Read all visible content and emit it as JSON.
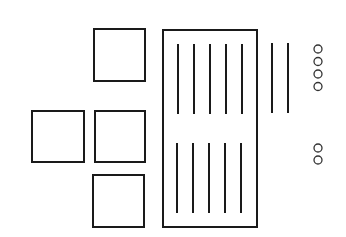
{
  "diagram": {
    "width": 346,
    "height": 237,
    "background": "#ffffff",
    "stroke": "#1a1a1a",
    "squares": [
      {
        "id": "square-top",
        "x": 94,
        "y": 29,
        "w": 51,
        "h": 52
      },
      {
        "id": "square-left",
        "x": 32,
        "y": 111,
        "w": 52,
        "h": 51
      },
      {
        "id": "square-middle",
        "x": 95,
        "y": 111,
        "w": 50,
        "h": 51
      },
      {
        "id": "square-bottom",
        "x": 93,
        "y": 175,
        "w": 51,
        "h": 52
      }
    ],
    "frame": {
      "id": "tall-rectangle",
      "x": 163,
      "y": 30,
      "w": 94,
      "h": 197
    },
    "lines": [
      {
        "group": "upper-inner",
        "x": 178,
        "y1": 44,
        "y2": 114
      },
      {
        "group": "upper-inner",
        "x": 194,
        "y1": 44,
        "y2": 114
      },
      {
        "group": "upper-inner",
        "x": 210,
        "y1": 44,
        "y2": 114
      },
      {
        "group": "upper-inner",
        "x": 226,
        "y1": 44,
        "y2": 114
      },
      {
        "group": "upper-inner",
        "x": 242,
        "y1": 44,
        "y2": 114
      },
      {
        "group": "lower-inner",
        "x": 177,
        "y1": 143,
        "y2": 213
      },
      {
        "group": "lower-inner",
        "x": 193,
        "y1": 143,
        "y2": 213
      },
      {
        "group": "lower-inner",
        "x": 209,
        "y1": 143,
        "y2": 213
      },
      {
        "group": "lower-inner",
        "x": 225,
        "y1": 143,
        "y2": 213
      },
      {
        "group": "lower-inner",
        "x": 241,
        "y1": 143,
        "y2": 213
      },
      {
        "group": "outer",
        "x": 272,
        "y1": 43,
        "y2": 113
      },
      {
        "group": "outer",
        "x": 288,
        "y1": 43,
        "y2": 113
      }
    ],
    "circles": [
      {
        "group": "upper",
        "cx": 318,
        "cy": 49,
        "r": 4
      },
      {
        "group": "upper",
        "cx": 318,
        "cy": 61.5,
        "r": 4
      },
      {
        "group": "upper",
        "cx": 318,
        "cy": 74,
        "r": 4
      },
      {
        "group": "upper",
        "cx": 318,
        "cy": 86.5,
        "r": 4
      },
      {
        "group": "lower",
        "cx": 318,
        "cy": 148,
        "r": 4
      },
      {
        "group": "lower",
        "cx": 318,
        "cy": 160,
        "r": 4
      }
    ]
  }
}
